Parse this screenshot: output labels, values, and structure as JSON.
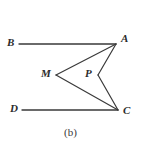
{
  "figure": {
    "caption": "(b)",
    "stroke_color": "#3a3a3a",
    "background_color": "#ffffff",
    "label_color": "#2b2b2b",
    "vertices": {
      "A": {
        "label": "A",
        "x": 116,
        "y": 44
      },
      "B": {
        "label": "B",
        "x": 19,
        "y": 44
      },
      "C": {
        "label": "C",
        "x": 118,
        "y": 110
      },
      "D": {
        "label": "D",
        "x": 22,
        "y": 110
      },
      "M": {
        "label": "M",
        "x": 56,
        "y": 75
      },
      "P": {
        "label": "P",
        "x": 98,
        "y": 75
      }
    },
    "segments": [
      {
        "name": "segment-BA",
        "from": "B",
        "to": "A"
      },
      {
        "name": "segment-DC",
        "from": "D",
        "to": "C"
      },
      {
        "name": "segment-MA",
        "from": "M",
        "to": "A"
      },
      {
        "name": "segment-MC",
        "from": "M",
        "to": "C"
      },
      {
        "name": "segment-AP",
        "from": "A",
        "to": "P"
      },
      {
        "name": "segment-PC",
        "from": "P",
        "to": "C"
      }
    ]
  }
}
